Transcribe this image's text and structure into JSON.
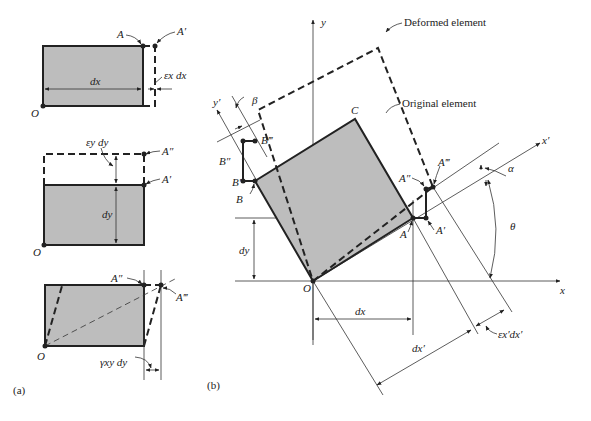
{
  "figure": {
    "panel_a": {
      "caption": "(a)",
      "sub1": {
        "labels": {
          "A": "A",
          "A_prime": "A′",
          "dx": "dx",
          "strain": "εx dx",
          "O": "O"
        }
      },
      "sub2": {
        "labels": {
          "A_dprime": "A″",
          "A_prime": "A′",
          "dy": "dy",
          "strain": "εy dy",
          "O": "O"
        }
      },
      "sub3": {
        "labels": {
          "A_dprime": "A″",
          "A_tprime": "A‴",
          "shear": "γxy dy",
          "O": "O"
        }
      }
    },
    "panel_b": {
      "caption": "(b)",
      "axis_x": "x",
      "axis_y": "y",
      "axis_xp": "x′",
      "axis_yp": "y′",
      "origin": "O",
      "corner_C": "C",
      "A": "A",
      "A_prime": "A′",
      "A_dprime": "A″",
      "A_tprime": "A‴",
      "B": "B",
      "B_prime": "B′",
      "B_dprime": "B″",
      "B_tprime": "B‴",
      "alpha": "α",
      "beta": "β",
      "theta": "θ",
      "dx": "dx",
      "dy": "dy",
      "dxp": "dx′",
      "strain": "εx′dx′",
      "deformed_label": "Deformed element",
      "original_label": "Original element"
    }
  }
}
